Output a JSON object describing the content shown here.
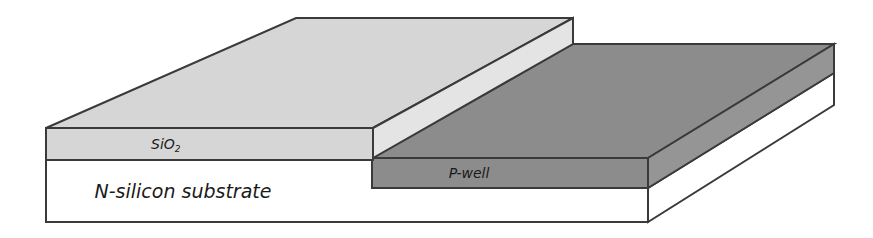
{
  "diagram": {
    "type": "semiconductor-cross-section",
    "colors": {
      "oxide": "#d6d6d6",
      "oxide_side": "#e4e4e4",
      "pwell": "#8c8c8c",
      "substrate": "#ffffff",
      "outline": "#3a3a3a"
    },
    "layers": {
      "oxide": {
        "label": "SiO",
        "subscript": "2"
      },
      "pwell": {
        "label": "P-well"
      },
      "substrate": {
        "label": "N-silicon substrate"
      }
    }
  }
}
